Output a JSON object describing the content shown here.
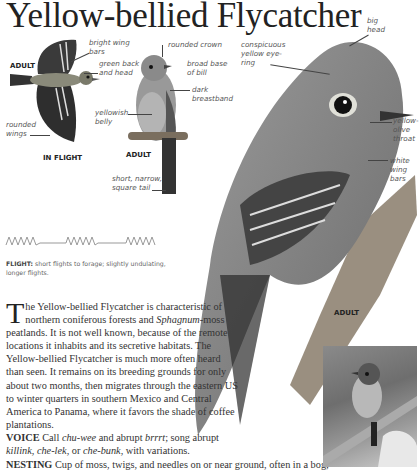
{
  "title": "Yellow-bellied Flycatcher",
  "illustrations": {
    "flight_bird": {
      "caption": "IN FLIGHT",
      "tag": "ADULT",
      "labels": {
        "bright_wing_bars": "bright wing bars",
        "green_back_head": "green back and head",
        "rounded_wings": "rounded wings"
      }
    },
    "perched_bird": {
      "caption": "ADULT",
      "labels": {
        "rounded_crown": "rounded crown",
        "broad_base_bill": "broad base of bill",
        "dark_breastband": "dark breastband",
        "yellowish_belly": "yellowish belly",
        "square_tail": "short, narrow, square tail"
      }
    },
    "large_bird": {
      "caption": "ADULT",
      "labels": {
        "big_head": "big head",
        "eye_ring": "conspicuous yellow eye-ring",
        "throat": "yellow-olive throat",
        "wing_bars": "white wing bars"
      }
    }
  },
  "flight": {
    "label": "FLIGHT:",
    "text": "short flights to forage; slightly undulating, longer flights."
  },
  "description": {
    "dropcap": "T",
    "p1": "he Yellow-bellied Flycatcher is characteristic of northern coniferous forests and ",
    "p1_italic": "Sphagnum",
    "p2": "-moss peatlands. It is not well known, because of the remote locations it inhabits and its secretive habitats. The Yellow-bellied Flycatcher is much more often heard than seen. It remains on its breeding grounds for only about two months, then migrates through the eastern US to winter quarters in southern Mexico and Central America to Panama, where it favors the shade of coffee plantations."
  },
  "voice": {
    "label": "VOICE",
    "t1": " Call ",
    "i1": "chu-wee",
    "t2": " and abrupt ",
    "i2": "brrrt",
    "t3": "; song abrupt ",
    "i3": "killink",
    "t4": ", ",
    "i4": "che-lek",
    "t5": ", or ",
    "i5": "che-bunk",
    "t6": ", with variations."
  },
  "nesting": {
    "label": "NESTING",
    "text": " Cup of moss, twigs, and needles on or near ground, often in a bog;"
  }
}
